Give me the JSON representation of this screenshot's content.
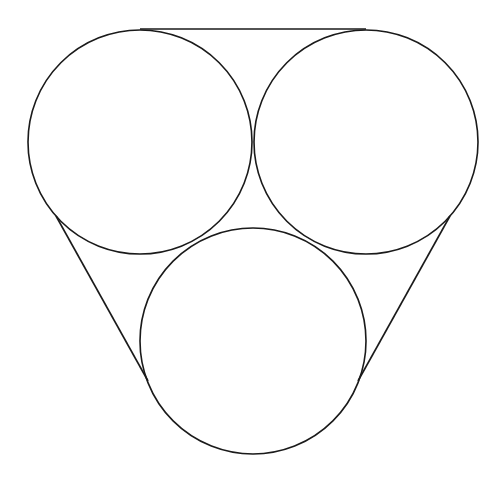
{
  "diagram": {
    "canvas": {
      "width": 490,
      "height": 479,
      "background": "#ffffff"
    },
    "stroke": {
      "color": "#1a1a1a",
      "width": 1.6
    },
    "circles": [
      {
        "id": "top-left",
        "cx": 140,
        "cy": 142,
        "r": 112
      },
      {
        "id": "top-right",
        "cx": 366,
        "cy": 142,
        "r": 112
      },
      {
        "id": "bottom",
        "cx": 253,
        "cy": 341,
        "r": 113
      }
    ],
    "tangent_lines": [
      {
        "id": "top",
        "x1": 140,
        "y1": 29,
        "x2": 366,
        "y2": 29
      },
      {
        "id": "left",
        "x1": 56,
        "y1": 216,
        "x2": 148,
        "y2": 381
      },
      {
        "id": "right",
        "x1": 450,
        "y1": 216,
        "x2": 358,
        "y2": 381
      }
    ]
  }
}
